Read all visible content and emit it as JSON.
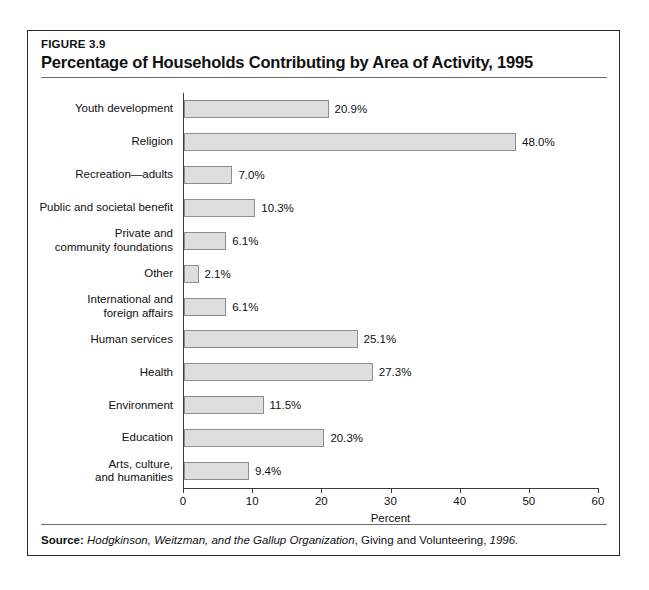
{
  "figure": {
    "number": "FIGURE 3.9",
    "title": "Percentage of Households Contributing by Area of Activity, 1995",
    "source_prefix": "Source:",
    "source_italic_1": "Hodgkinson, Weitzman, and the Gallup Organization",
    "source_plain_1": ", Giving and Volunteering, ",
    "source_italic_2": "1996.",
    "source_full": "Source: Hodgkinson, Weitzman, and the Gallup Organization, Giving and Volunteering, 1996."
  },
  "colors": {
    "bar_fill": "#dedede",
    "bar_border": "#8e8e8e",
    "axis": "#3a3a3a",
    "frame": "#2b2b2b",
    "rule": "#6d6d6d",
    "text": "#111111",
    "background": "#ffffff"
  },
  "chart_data": {
    "type": "bar",
    "orientation": "horizontal",
    "title": "Percentage of Households Contributing by Area of Activity, 1995",
    "xlabel": "Percent",
    "ylabel": "",
    "xlim": [
      0,
      60
    ],
    "xticks": [
      0,
      10,
      20,
      30,
      40,
      50,
      60
    ],
    "xtick_labels": [
      "0",
      "10",
      "20",
      "30",
      "40",
      "50",
      "60"
    ],
    "grid": false,
    "legend": false,
    "categories": [
      "Youth development",
      "Religion",
      "Recreation—adults",
      "Public and societal benefit",
      "Private and community foundations",
      "Other",
      "International and foreign affairs",
      "Human services",
      "Health",
      "Environment",
      "Education",
      "Arts, culture, and humanities"
    ],
    "category_lines": [
      [
        "Youth development"
      ],
      [
        "Religion"
      ],
      [
        "Recreation—adults"
      ],
      [
        "Public and societal benefit"
      ],
      [
        "Private and",
        "community foundations"
      ],
      [
        "Other"
      ],
      [
        "International and",
        "foreign affairs"
      ],
      [
        "Human services"
      ],
      [
        "Health"
      ],
      [
        "Environment"
      ],
      [
        "Education"
      ],
      [
        "Arts, culture,",
        "and humanities"
      ]
    ],
    "values": [
      20.9,
      48.0,
      7.0,
      10.3,
      6.1,
      2.1,
      6.1,
      25.1,
      27.3,
      11.5,
      20.3,
      9.4
    ],
    "value_labels": [
      "20.9%",
      "48.0%",
      "7.0%",
      "10.3%",
      "6.1%",
      "2.1%",
      "6.1%",
      "25.1%",
      "27.3%",
      "11.5%",
      "20.3%",
      "9.4%"
    ]
  }
}
